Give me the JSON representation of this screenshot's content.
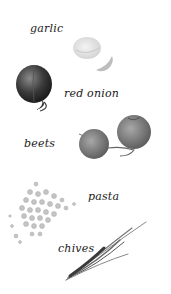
{
  "illustration": {
    "items": [
      {
        "label": "garlic",
        "icon": "garlic-icon"
      },
      {
        "label": "red onion",
        "icon": "red-onion-icon"
      },
      {
        "label": "beets",
        "icon": "beets-icon"
      },
      {
        "label": "pasta",
        "icon": "pasta-icon"
      },
      {
        "label": "chives",
        "icon": "chives-icon"
      }
    ]
  }
}
